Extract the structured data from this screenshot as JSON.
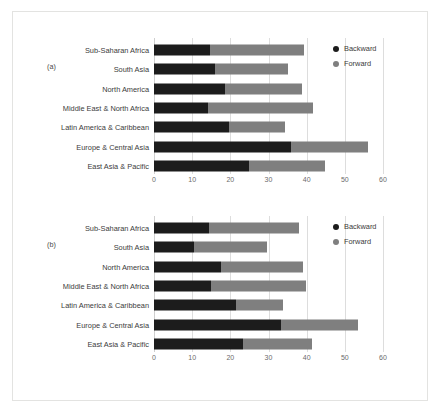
{
  "figure": {
    "background_color": "#ffffff",
    "card_border_color": "#e3e3e1"
  },
  "legend": {
    "position": "top-right",
    "items": [
      {
        "label": "Backward",
        "color": "#1c1c1c",
        "dot": "legend-dot-backward"
      },
      {
        "label": "Forward",
        "color": "#7f7f7f",
        "dot": "legend-dot-forward"
      }
    ]
  },
  "panels": [
    {
      "tag": "(a)"
    },
    {
      "tag": "(b)"
    }
  ],
  "chart_data": [
    {
      "type": "bar",
      "orientation": "horizontal",
      "stacked": true,
      "panel": "(a)",
      "title": "",
      "xlabel": "",
      "ylabel": "",
      "xlim": [
        0,
        60
      ],
      "xticks": [
        0,
        10,
        20,
        30,
        40,
        50,
        60
      ],
      "grid": true,
      "legend": [
        "Backward",
        "Forward"
      ],
      "categories": [
        "Sub-Saharan Africa",
        "South Asia",
        "North America",
        "Middle East & North Africa",
        "Latin America & Caribbean",
        "Europe & Central Asia",
        "East Asia & Pacific"
      ],
      "series": [
        {
          "name": "Backward",
          "color": "#1c1c1c",
          "values": [
            14.7,
            16.1,
            18.7,
            14.2,
            19.7,
            36.0,
            24.8
          ]
        },
        {
          "name": "Forward",
          "color": "#7f7f7f",
          "values": [
            24.7,
            19.0,
            20.0,
            27.4,
            14.7,
            20.1,
            20.0
          ]
        }
      ],
      "totals": [
        39.4,
        35.1,
        38.7,
        41.6,
        34.4,
        56.1,
        44.8
      ]
    },
    {
      "type": "bar",
      "orientation": "horizontal",
      "stacked": true,
      "panel": "(b)",
      "title": "",
      "xlabel": "",
      "ylabel": "",
      "xlim": [
        0,
        60
      ],
      "xticks": [
        0,
        10,
        20,
        30,
        40,
        50,
        60
      ],
      "grid": true,
      "legend": [
        "Backward",
        "Forward"
      ],
      "categories": [
        "Sub-Saharan Africa",
        "South Asia",
        "North America",
        "Middle East & North Africa",
        "Latin America & Caribbean",
        "Europe & Central Asia",
        "East Asia & Pacific"
      ],
      "series": [
        {
          "name": "Backward",
          "color": "#1c1c1c",
          "values": [
            14.3,
            10.5,
            17.5,
            15.0,
            21.6,
            33.4,
            23.2
          ]
        },
        {
          "name": "Forward",
          "color": "#7f7f7f",
          "values": [
            23.7,
            19.0,
            21.5,
            24.8,
            12.2,
            20.1,
            18.1
          ]
        }
      ],
      "totals": [
        38.0,
        29.5,
        39.0,
        39.8,
        33.8,
        53.5,
        41.3
      ]
    }
  ]
}
